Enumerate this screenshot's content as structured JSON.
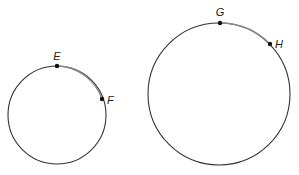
{
  "colors": {
    "circle_stroke": "#333333",
    "arc_highlight": "#8a8a8a",
    "point_fill": "#111111",
    "background": "#ffffff"
  },
  "circles": [
    {
      "name": "small-circle",
      "center": [
        57,
        115
      ],
      "radius": 49,
      "points": [
        {
          "label": "E",
          "position": [
            57,
            66
          ],
          "label_position": [
            57,
            60
          ],
          "anchor": "middle"
        },
        {
          "label": "F",
          "position": [
            102,
            99
          ],
          "label_position": [
            107,
            104
          ],
          "anchor": "start"
        }
      ]
    },
    {
      "name": "large-circle",
      "center": [
        219,
        94
      ],
      "radius": 71,
      "points": [
        {
          "label": "G",
          "position": [
            220,
            23
          ],
          "label_position": [
            220,
            16
          ],
          "anchor": "middle"
        },
        {
          "label": "H",
          "position": [
            270,
            44
          ],
          "label_position": [
            275,
            48
          ],
          "anchor": "start"
        }
      ]
    }
  ]
}
